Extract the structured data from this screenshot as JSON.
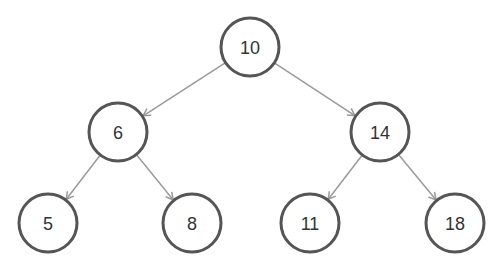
{
  "diagram": {
    "type": "binary-search-tree",
    "style": {
      "node_stroke": "#555555",
      "node_fill": "#ffffff",
      "edge_color": "#9a9a9a",
      "text_color": "#333333",
      "node_radius": 29
    },
    "nodes": [
      {
        "id": "n10",
        "label": "10",
        "x": 250,
        "y": 47
      },
      {
        "id": "n6",
        "label": "6",
        "x": 118,
        "y": 132
      },
      {
        "id": "n14",
        "label": "14",
        "x": 380,
        "y": 132
      },
      {
        "id": "n5",
        "label": "5",
        "x": 48,
        "y": 223
      },
      {
        "id": "n8",
        "label": "8",
        "x": 192,
        "y": 223
      },
      {
        "id": "n11",
        "label": "11",
        "x": 310,
        "y": 223
      },
      {
        "id": "n18",
        "label": "18",
        "x": 455,
        "y": 223
      }
    ],
    "edges": [
      {
        "from": "n10",
        "to": "n6"
      },
      {
        "from": "n10",
        "to": "n14"
      },
      {
        "from": "n6",
        "to": "n5"
      },
      {
        "from": "n6",
        "to": "n8"
      },
      {
        "from": "n14",
        "to": "n11"
      },
      {
        "from": "n14",
        "to": "n18"
      }
    ]
  }
}
